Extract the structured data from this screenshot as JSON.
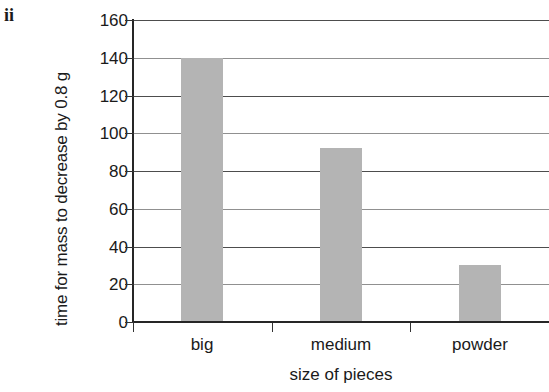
{
  "figure": {
    "enumeration_label": "ii"
  },
  "chart_data": {
    "type": "bar",
    "title": "",
    "categories": [
      "big",
      "medium",
      "powder"
    ],
    "values": [
      140,
      92,
      30
    ],
    "series": [
      {
        "name": "time for mass to decrease by 0.8 g",
        "values": [
          140,
          92,
          30
        ]
      }
    ],
    "xlabel": "size of pieces",
    "ylabel": "time for mass to decrease by 0.8 g",
    "ylim": [
      0,
      160
    ],
    "ytick_step": 20,
    "yticks": [
      0,
      20,
      40,
      60,
      80,
      100,
      120,
      140,
      160
    ],
    "ytick_labels": [
      "0",
      "20",
      "40",
      "60",
      "80",
      "100",
      "120",
      "140",
      "160"
    ],
    "grid": true,
    "grid_axis": "y",
    "legend": false,
    "legend_position": "none",
    "bar_color": "#b4b4b4",
    "axis_color": "#262626",
    "grid_color": "#4d4d4d",
    "background_color": "#ffffff"
  }
}
